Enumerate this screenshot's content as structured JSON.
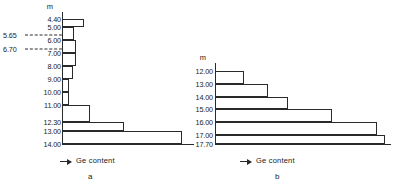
{
  "figure": {
    "panels": [
      {
        "id": "a",
        "caption": "a",
        "unit_header": "m",
        "xlabel": "Ge content",
        "axis_arrow_icon": "right-arrow-icon"
      },
      {
        "id": "b",
        "caption": "b",
        "unit_header": "m",
        "xlabel": "Ge content",
        "axis_arrow_icon": "right-arrow-icon"
      }
    ]
  },
  "chart_data": [
    {
      "type": "bar",
      "orientation": "horizontal",
      "panel": "a",
      "title": "a",
      "xlabel": "Ge content",
      "ylabel": "m",
      "grid": false,
      "legend": null,
      "categories": [
        "4.40",
        "5.00",
        "6.00",
        "7.00",
        "8.00",
        "9.00",
        "10.00",
        "11.00",
        "12.30",
        "13.00",
        "14.00"
      ],
      "tick_labels": [
        "4.40",
        "5.00",
        "6.00",
        "7.00",
        "8.00",
        "9.00",
        "10.00",
        "11.00",
        "12.30",
        "13.00",
        "14.00"
      ],
      "annotations": [
        {
          "label": "5.65",
          "depth": 5.65,
          "style": "dashed-leader"
        },
        {
          "label": "6.70",
          "depth": 6.7,
          "style": "dashed-leader"
        }
      ],
      "bars": [
        {
          "from": "4.40",
          "to": "5.00",
          "value": 18
        },
        {
          "from": "5.00",
          "to": "6.00",
          "value": 10
        },
        {
          "from": "6.00",
          "to": "7.00",
          "value": 12
        },
        {
          "from": "7.00",
          "to": "8.00",
          "value": 12
        },
        {
          "from": "8.00",
          "to": "9.00",
          "value": 9
        },
        {
          "from": "9.00",
          "to": "10.00",
          "value": 6
        },
        {
          "from": "10.00",
          "to": "11.00",
          "value": 6
        },
        {
          "from": "11.00",
          "to": "12.30",
          "value": 23
        },
        {
          "from": "12.30",
          "to": "13.00",
          "value": 52
        },
        {
          "from": "13.00",
          "to": "14.00",
          "value": 100
        }
      ],
      "values": [
        18,
        10,
        12,
        12,
        9,
        6,
        6,
        23,
        52,
        100
      ],
      "xlim": [
        0,
        100
      ],
      "ylim": [
        4.4,
        14.0
      ]
    },
    {
      "type": "bar",
      "orientation": "horizontal",
      "panel": "b",
      "title": "b",
      "xlabel": "Ge content",
      "ylabel": "m",
      "grid": false,
      "legend": null,
      "categories": [
        "12.00",
        "13.00",
        "14.00",
        "15.00",
        "16.00",
        "17.00",
        "17.70"
      ],
      "tick_labels": [
        "12.00",
        "13.00",
        "14.00",
        "15.00",
        "16.00",
        "17.00",
        "17.70"
      ],
      "annotations": [],
      "bars": [
        {
          "from": "12.00",
          "to": "13.00",
          "value": 17
        },
        {
          "from": "13.00",
          "to": "14.00",
          "value": 31
        },
        {
          "from": "14.00",
          "to": "15.00",
          "value": 43
        },
        {
          "from": "15.00",
          "to": "16.00",
          "value": 69
        },
        {
          "from": "16.00",
          "to": "17.00",
          "value": 95
        },
        {
          "from": "17.00",
          "to": "17.70",
          "value": 100
        }
      ],
      "values": [
        17,
        31,
        43,
        69,
        95,
        100
      ],
      "xlim": [
        0,
        100
      ],
      "ylim": [
        12.0,
        17.7
      ]
    }
  ]
}
